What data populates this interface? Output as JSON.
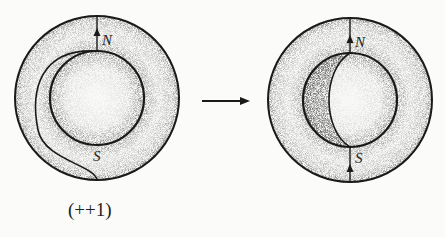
{
  "diagram": {
    "left_figure": {
      "north_label": "N",
      "south_label": "S",
      "caption": "(++1)"
    },
    "right_figure": {
      "north_label": "N",
      "south_label": "S"
    },
    "transition_arrow": "right-arrow",
    "colors": {
      "ink": "#1a1a1a",
      "paper": "#fbfbf9"
    }
  }
}
